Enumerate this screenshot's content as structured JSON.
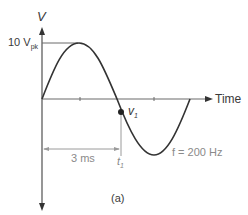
{
  "figure": {
    "y_axis_label": "V",
    "x_axis_label": "Time",
    "peak_label_main": "10 V",
    "peak_label_sub": "pk",
    "point_label_main": "v",
    "point_label_sub": "1",
    "time_marker_main": "t",
    "time_marker_sub": "1",
    "interval_label": "3 ms",
    "frequency_label": "f = 200 Hz",
    "caption": "(a)"
  },
  "colors": {
    "curve": "#333333",
    "axis": "#6a6a6a",
    "dimension": "#9a9a9a"
  }
}
